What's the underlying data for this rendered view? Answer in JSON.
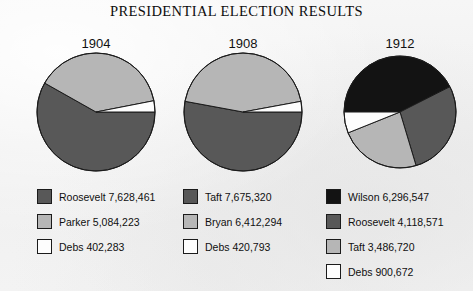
{
  "title": "PRESIDENTIAL ELECTION RESULTS",
  "colors": {
    "background": "#f2f2f2",
    "outline": "#1b1b1b",
    "black": "#131313",
    "dark_gray": "#585858",
    "light_gray": "#b6b6b6",
    "white": "#fdfdfd"
  },
  "chart_data": {
    "type": "pie",
    "title": "PRESIDENTIAL ELECTION RESULTS",
    "legend_position": "below-each-chart",
    "charts": [
      {
        "year": "1904",
        "center_x": 96,
        "center_y": 112,
        "radius": 59,
        "slices": [
          {
            "label": "Roosevelt",
            "value": 7628461,
            "value_text": "7,628,461",
            "text": "Roosevelt 7,628,461",
            "color": "#585858",
            "percent": 58.2
          },
          {
            "label": "Parker",
            "value": 5084223,
            "value_text": "5,084,223",
            "text": "Parker 5,084,223",
            "color": "#b6b6b6",
            "percent": 38.8
          },
          {
            "label": "Debs",
            "value": 402283,
            "value_text": "402,283",
            "text": "Debs 402,283",
            "color": "#fdfdfd",
            "percent": 3.0
          }
        ]
      },
      {
        "year": "1908",
        "center_x": 243,
        "center_y": 112,
        "radius": 59,
        "slices": [
          {
            "label": "Taft",
            "value": 7675320,
            "value_text": "7,675,320",
            "text": "Taft 7,675,320",
            "color": "#585858",
            "percent": 52.9
          },
          {
            "label": "Bryan",
            "value": 6412294,
            "value_text": "6,412,294",
            "text": "Bryan 6,412,294",
            "color": "#b6b6b6",
            "percent": 44.2
          },
          {
            "label": "Debs",
            "value": 420793,
            "value_text": "420,793",
            "text": "Debs 420,793",
            "color": "#fdfdfd",
            "percent": 2.9
          }
        ]
      },
      {
        "year": "1912",
        "center_x": 400,
        "center_y": 112,
        "radius": 56,
        "slices": [
          {
            "label": "Wilson",
            "value": 6296547,
            "value_text": "6,296,547",
            "text": "Wilson 6,296,547",
            "color": "#131313",
            "percent": 42.0
          },
          {
            "label": "Roosevelt",
            "value": 4118571,
            "value_text": "4,118,571",
            "text": "Roosevelt 4,118,571",
            "color": "#585858",
            "percent": 27.4
          },
          {
            "label": "Taft",
            "value": 3486720,
            "value_text": "3,486,720",
            "text": "Taft 3,486,720",
            "color": "#b6b6b6",
            "percent": 23.2
          },
          {
            "label": "Debs",
            "value": 900672,
            "value_text": "900,672",
            "text": "Debs 900,672",
            "color": "#fdfdfd",
            "percent": 6.0
          }
        ]
      }
    ]
  }
}
